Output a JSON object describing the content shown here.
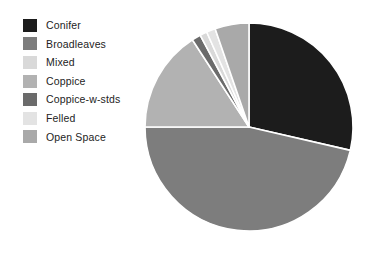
{
  "figure": {
    "type": "pie-chart-with-legend",
    "width": 373,
    "height": 260,
    "background": "#ffffff"
  },
  "legend": {
    "position": "left",
    "items": [
      {
        "label": "Conifer",
        "color": "#1c1c1c"
      },
      {
        "label": "Broadleaves",
        "color": "#7d7d7d"
      },
      {
        "label": "Mixed",
        "color": "#d9d9d9"
      },
      {
        "label": "Coppice",
        "color": "#b2b2b2"
      },
      {
        "label": "Coppice-w-stds",
        "color": "#6b6b6b"
      },
      {
        "label": "Felled",
        "color": "#e3e3e3"
      },
      {
        "label": "Open Space",
        "color": "#a9a9a9"
      }
    ]
  },
  "pie": {
    "center_x": 249,
    "center_y": 127,
    "radius": 104,
    "start_angle_deg": 0,
    "direction": "clockwise",
    "separator_color": "#ffffff",
    "separator_width": 1.6
  },
  "chart_data": {
    "type": "pie",
    "title": "",
    "subtitle": "",
    "xlabel": "",
    "ylabel": "",
    "grid": false,
    "legend_position": "left",
    "labels": [
      "Conifer",
      "Broadleaves",
      "Coppice",
      "Coppice-w-stds",
      "Mixed",
      "Felled",
      "Open Space"
    ],
    "values": [
      28.6,
      46.4,
      15.8,
      1.4,
      1.1,
      1.4,
      5.3
    ],
    "unit": "percent",
    "colors": [
      "#1c1c1c",
      "#7d7d7d",
      "#b2b2b2",
      "#6b6b6b",
      "#d9d9d9",
      "#e3e3e3",
      "#a9a9a9"
    ],
    "slice_angles_deg": [
      103.0,
      167.0,
      57.0,
      5.0,
      4.0,
      5.0,
      19.0
    ],
    "slices": [
      {
        "label": "Conifer",
        "value": 28.6,
        "angle_deg": 103.0,
        "color": "#1c1c1c"
      },
      {
        "label": "Broadleaves",
        "value": 46.4,
        "angle_deg": 167.0,
        "color": "#7d7d7d"
      },
      {
        "label": "Coppice",
        "value": 15.8,
        "angle_deg": 57.0,
        "color": "#b2b2b2"
      },
      {
        "label": "Coppice-w-stds",
        "value": 1.4,
        "angle_deg": 5.0,
        "color": "#6b6b6b"
      },
      {
        "label": "Mixed",
        "value": 1.1,
        "angle_deg": 4.0,
        "color": "#d9d9d9"
      },
      {
        "label": "Felled",
        "value": 1.4,
        "angle_deg": 5.0,
        "color": "#e3e3e3"
      },
      {
        "label": "Open Space",
        "value": 5.3,
        "angle_deg": 19.0,
        "color": "#a9a9a9"
      }
    ]
  }
}
